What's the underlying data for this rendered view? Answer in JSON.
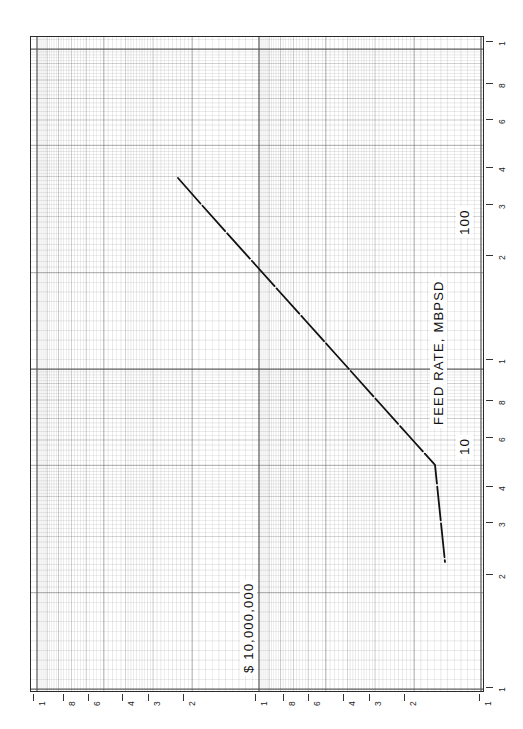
{
  "figure": {
    "kind": "log-log-graph-paper",
    "background_color": "#ffffff",
    "grid_color": "#555555",
    "curve_color": "#111111"
  },
  "axes": {
    "x_axis": {
      "title": "FEED RATE, MBPSD",
      "orientation": "rotated-90",
      "scale": "log",
      "decade_labels": [
        "10",
        "100"
      ],
      "tick_labels": [
        "1",
        "8",
        "6",
        "4",
        "3",
        "2",
        "1",
        "8",
        "6",
        "4",
        "3",
        "2",
        "1"
      ]
    },
    "y_axis": {
      "title": "$ 10,000,000",
      "orientation": "rotated-90",
      "scale": "log",
      "tick_labels": [
        "1",
        "8",
        "6",
        "4",
        "3",
        "2",
        "1",
        "8",
        "6",
        "4",
        "3",
        "2",
        "1"
      ]
    }
  },
  "chart_data": {
    "type": "line",
    "title": "",
    "subtitle": "",
    "xlabel": "FEED RATE, MBPSD",
    "ylabel": "$ 10,000,000",
    "xscale": "log",
    "yscale": "log",
    "grid": true,
    "legend": "none",
    "xlim": [
      1,
      100
    ],
    "ylim": [
      1,
      100
    ],
    "x_tick_labels": [
      "1",
      "2",
      "3",
      "4",
      "6",
      "8",
      "1",
      "2",
      "3",
      "4",
      "6",
      "8",
      "1"
    ],
    "y_tick_labels": [
      "1",
      "2",
      "3",
      "4",
      "6",
      "8",
      "1",
      "2",
      "3",
      "4",
      "6",
      "8",
      "1"
    ],
    "annotations": [
      "10",
      "100"
    ],
    "series": [
      {
        "name": "cost vs feed rate",
        "style": "solid-dashed",
        "x": [
          2.1,
          3.0,
          4.5,
          6.5,
          10.0,
          16.0,
          25.0,
          40.0,
          60.0,
          90.0,
          140.0
        ],
        "y": [
          42.0,
          33.0,
          25.0,
          19.0,
          14.0,
          10.5,
          8.0,
          6.2,
          4.9,
          3.9,
          3.2
        ],
        "pixel_points": [
          [
            178,
            178
          ],
          [
            200,
            203
          ],
          [
            226,
            232
          ],
          [
            252,
            261
          ],
          [
            278,
            290
          ],
          [
            305,
            320
          ],
          [
            331,
            349
          ],
          [
            357,
            378
          ],
          [
            383,
            407
          ],
          [
            409,
            436
          ],
          [
            435,
            465
          ],
          [
            445,
            562
          ]
        ]
      }
    ]
  },
  "bottom_ticks": [
    {
      "label": "1",
      "x": 33
    },
    {
      "label": "8",
      "x": 63
    },
    {
      "label": "6",
      "x": 88
    },
    {
      "label": "4",
      "x": 122
    },
    {
      "label": "3",
      "x": 148
    },
    {
      "label": "2",
      "x": 183
    },
    {
      "label": "1",
      "x": 255
    },
    {
      "label": "8",
      "x": 283
    },
    {
      "label": "6",
      "x": 308
    },
    {
      "label": "4",
      "x": 343
    },
    {
      "label": "3",
      "x": 369
    },
    {
      "label": "2",
      "x": 404
    },
    {
      "label": "1",
      "x": 479
    }
  ],
  "right_ticks": [
    {
      "label": "1",
      "y": 41
    },
    {
      "label": "8",
      "y": 83
    },
    {
      "label": "6",
      "y": 119
    },
    {
      "label": "4",
      "y": 167
    },
    {
      "label": "3",
      "y": 204
    },
    {
      "label": "2",
      "y": 255
    },
    {
      "label": "1",
      "y": 359
    },
    {
      "label": "8",
      "y": 400
    },
    {
      "label": "6",
      "y": 437
    },
    {
      "label": "4",
      "y": 486
    },
    {
      "label": "3",
      "y": 522
    },
    {
      "label": "2",
      "y": 574
    },
    {
      "label": "1",
      "y": 687
    }
  ],
  "decade_markers": [
    {
      "label": "100",
      "x": 456,
      "y": 238
    },
    {
      "label": "10",
      "x": 456,
      "y": 458
    }
  ],
  "axis_title_positions": {
    "x_title": {
      "x": 430,
      "y": 428
    },
    "y_title": {
      "x": 240,
      "y": 676
    }
  }
}
